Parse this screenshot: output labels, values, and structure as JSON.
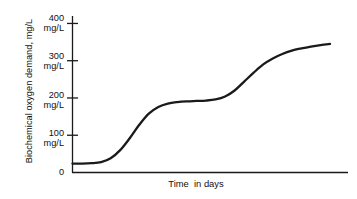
{
  "chart_data": {
    "type": "line",
    "title": "",
    "ylabel": "Biochemical oxygen demand, mg/L",
    "xlabel": "Time  in days",
    "ylim": [
      0,
      420
    ],
    "xlim": [
      0,
      20
    ],
    "grid": false,
    "legend": null,
    "y_ticks": [
      {
        "value": 400,
        "label_number": "400",
        "label_unit": "mg/L"
      },
      {
        "value": 300,
        "label_number": "300",
        "label_unit": "mg/L"
      },
      {
        "value": 200,
        "label_number": "200",
        "label_unit": "mg/L"
      },
      {
        "value": 100,
        "label_number": "100",
        "label_unit": "mg/L"
      },
      {
        "value": 0,
        "label_number": "0",
        "label_unit": ""
      }
    ],
    "x_ticks": [],
    "series": [
      {
        "name": "Biochemical oxygen demand",
        "color": "#1a1a1a",
        "x": [
          0.0,
          0.6,
          1.2,
          1.8,
          2.4,
          3.0,
          3.6,
          4.2,
          4.8,
          5.4,
          6.0,
          6.6,
          7.2,
          7.8,
          8.4,
          9.0,
          9.6,
          10.2,
          10.8,
          11.4,
          12.0,
          12.6,
          13.2,
          13.8,
          14.4,
          15.0,
          15.6,
          16.2
        ],
        "y": [
          24,
          24,
          25,
          28,
          38,
          60,
          92,
          128,
          158,
          176,
          185,
          189,
          191,
          192,
          193,
          196,
          204,
          220,
          244,
          268,
          290,
          306,
          318,
          327,
          333,
          338,
          342,
          345
        ]
      }
    ]
  },
  "axis": {
    "y_axis_name": "y-axis",
    "x_axis_name": "x-axis"
  }
}
